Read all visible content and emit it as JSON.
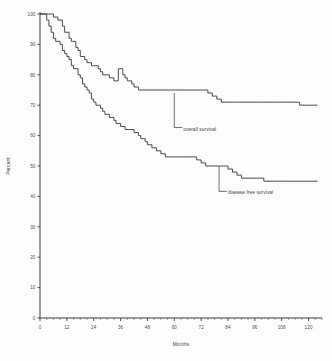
{
  "chart_data": {
    "type": "line",
    "title": "",
    "subtitle": "",
    "xlabel": "Months",
    "ylabel": "Percent",
    "xlim": [
      0,
      126
    ],
    "ylim": [
      0,
      100
    ],
    "grid": false,
    "legend_position": "inline-annotation",
    "x_ticks": [
      0,
      12,
      24,
      36,
      48,
      60,
      72,
      84,
      96,
      108,
      120
    ],
    "x_tick_labels": [
      "0",
      "12",
      "24",
      "36",
      "48",
      "60",
      "72",
      "84",
      "96",
      "108",
      "120"
    ],
    "x_minor_tick_step": 3,
    "y_ticks": [
      0,
      10,
      20,
      30,
      40,
      50,
      60,
      70,
      80,
      90,
      100
    ],
    "y_tick_labels": [
      "0",
      "10",
      "20",
      "30",
      "40",
      "50",
      "60",
      "70",
      "80",
      "90",
      "100"
    ],
    "annotations": [
      {
        "name": "overall-survival-label",
        "text": "overall survival",
        "x_month": 64,
        "y_percent": 62,
        "leader_to_x": 60,
        "leader_to_y": 74
      },
      {
        "name": "disease-free-survival-label",
        "text": "disease free survival",
        "x_month": 84,
        "y_percent": 41,
        "leader_to_x": 80,
        "leader_to_y": 50
      }
    ],
    "series": [
      {
        "name": "overall survival",
        "label": "overall survival",
        "color": "#373737",
        "step": "post",
        "points": [
          [
            0,
            100
          ],
          [
            4,
            100
          ],
          [
            6,
            99
          ],
          [
            8,
            98
          ],
          [
            10,
            96
          ],
          [
            11,
            94
          ],
          [
            13,
            92
          ],
          [
            14,
            91
          ],
          [
            16,
            89
          ],
          [
            17,
            88
          ],
          [
            18,
            86
          ],
          [
            20,
            85
          ],
          [
            21,
            84
          ],
          [
            23,
            83
          ],
          [
            24,
            83
          ],
          [
            26,
            82
          ],
          [
            27,
            81
          ],
          [
            28,
            80
          ],
          [
            30,
            80
          ],
          [
            31,
            79
          ],
          [
            33,
            78
          ],
          [
            34,
            78
          ],
          [
            35,
            82
          ],
          [
            36,
            82
          ],
          [
            37,
            80
          ],
          [
            38,
            79
          ],
          [
            39,
            78
          ],
          [
            41,
            77
          ],
          [
            42,
            76
          ],
          [
            44,
            75
          ],
          [
            46,
            75
          ],
          [
            50,
            75
          ],
          [
            55,
            75
          ],
          [
            60,
            75
          ],
          [
            66,
            75
          ],
          [
            70,
            75
          ],
          [
            73,
            75
          ],
          [
            75,
            74
          ],
          [
            77,
            73
          ],
          [
            79,
            72
          ],
          [
            81,
            71
          ],
          [
            86,
            71
          ],
          [
            92,
            71
          ],
          [
            98,
            71
          ],
          [
            104,
            71
          ],
          [
            110,
            71
          ],
          [
            116,
            70
          ],
          [
            120,
            70
          ],
          [
            124,
            70
          ]
        ]
      },
      {
        "name": "disease free survival",
        "label": "disease free survival",
        "color": "#373737",
        "step": "post",
        "points": [
          [
            0,
            100
          ],
          [
            2,
            100
          ],
          [
            3,
            98
          ],
          [
            4,
            96
          ],
          [
            5,
            94
          ],
          [
            6,
            92
          ],
          [
            7,
            91
          ],
          [
            9,
            90
          ],
          [
            10,
            88
          ],
          [
            11,
            87
          ],
          [
            12,
            86
          ],
          [
            13,
            85
          ],
          [
            14,
            83
          ],
          [
            15,
            82
          ],
          [
            17,
            80
          ],
          [
            18,
            79
          ],
          [
            19,
            77
          ],
          [
            20,
            76
          ],
          [
            21,
            75
          ],
          [
            22,
            74
          ],
          [
            23,
            72
          ],
          [
            24,
            71
          ],
          [
            25,
            70
          ],
          [
            27,
            69
          ],
          [
            28,
            68
          ],
          [
            29,
            67
          ],
          [
            31,
            66
          ],
          [
            33,
            65
          ],
          [
            34,
            64
          ],
          [
            36,
            63
          ],
          [
            38,
            62
          ],
          [
            40,
            62
          ],
          [
            42,
            61
          ],
          [
            44,
            60
          ],
          [
            45,
            59
          ],
          [
            47,
            58
          ],
          [
            48,
            57
          ],
          [
            50,
            56
          ],
          [
            52,
            55
          ],
          [
            54,
            54
          ],
          [
            56,
            53
          ],
          [
            60,
            53
          ],
          [
            64,
            53
          ],
          [
            68,
            53
          ],
          [
            70,
            52
          ],
          [
            72,
            51
          ],
          [
            74,
            50
          ],
          [
            78,
            50
          ],
          [
            82,
            50
          ],
          [
            84,
            49
          ],
          [
            86,
            48
          ],
          [
            88,
            47
          ],
          [
            90,
            46
          ],
          [
            94,
            46
          ],
          [
            98,
            46
          ],
          [
            100,
            45
          ],
          [
            104,
            45
          ],
          [
            110,
            45
          ],
          [
            116,
            45
          ],
          [
            120,
            45
          ],
          [
            124,
            45
          ]
        ]
      }
    ]
  }
}
